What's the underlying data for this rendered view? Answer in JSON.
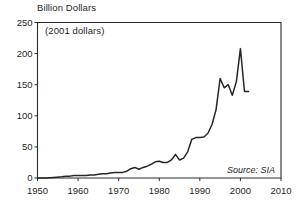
{
  "chart_data": {
    "type": "line",
    "title": "Billion Dollars",
    "subtitle": "(2001 dollars)",
    "source": "Source: SIA",
    "xlabel": "",
    "ylabel": "",
    "xlim": [
      1950,
      2010
    ],
    "ylim": [
      0,
      250
    ],
    "grid": false,
    "legend": "none",
    "xticks": [
      1950,
      1960,
      1970,
      1980,
      1990,
      2000,
      2010
    ],
    "yticks": [
      0,
      50,
      100,
      150,
      200,
      250
    ],
    "xtick_labels": [
      "1950",
      "1960",
      "1970",
      "1980",
      "1990",
      "2000",
      "2010"
    ],
    "ytick_labels": [
      "0",
      "50",
      "100",
      "150",
      "200",
      "250"
    ],
    "series": [
      {
        "name": "Semiconductor sales",
        "x": [
          1950,
          1952,
          1954,
          1956,
          1957,
          1958,
          1959,
          1960,
          1961,
          1962,
          1963,
          1964,
          1965,
          1966,
          1967,
          1968,
          1969,
          1970,
          1971,
          1972,
          1973,
          1974,
          1975,
          1976,
          1977,
          1978,
          1979,
          1980,
          1981,
          1982,
          1983,
          1984,
          1985,
          1986,
          1987,
          1988,
          1989,
          1990,
          1991,
          1992,
          1993,
          1994,
          1995,
          1996,
          1997,
          1998,
          1999,
          2000,
          2001,
          2002
        ],
        "y": [
          0,
          0,
          1,
          2,
          3,
          3,
          4,
          4,
          4,
          4,
          5,
          5,
          6,
          7,
          7,
          8,
          9,
          9,
          9,
          11,
          15,
          17,
          14,
          17,
          19,
          22,
          26,
          27,
          25,
          25,
          29,
          38,
          29,
          32,
          42,
          62,
          65,
          65,
          66,
          72,
          86,
          110,
          160,
          145,
          150,
          133,
          155,
          208,
          139,
          139
        ],
        "color": "#262626"
      }
    ],
    "annotations": [
      {
        "text": "(2001 dollars)",
        "x": 1953,
        "y": 232
      },
      {
        "text": "Source: SIA",
        "x": 2000,
        "y": 22
      }
    ]
  },
  "figure": {
    "width": 299,
    "height": 207,
    "background": "#ffffff",
    "axis_color": "#2b2b2b",
    "text_color": "#1f1f1f"
  }
}
